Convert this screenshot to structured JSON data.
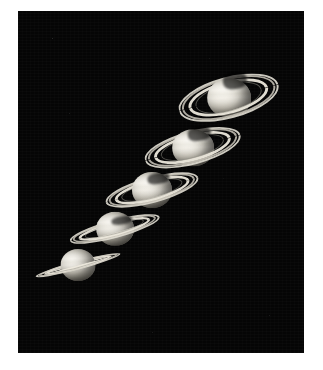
{
  "image": {
    "title": "Saturn ring-tilt sequence",
    "subject": "Saturn",
    "view_type": "photographic plate",
    "frame_count": 5,
    "background_color": "#050505",
    "border_color": "#ffffff",
    "plate": {
      "x": 18,
      "y": 11,
      "width": 286,
      "height": 342
    }
  },
  "frames": [
    {
      "id": "saturn-frame-5",
      "label": "Saturn with rings nearly edge-on",
      "order": 1,
      "center_x": 60,
      "center_y": 254,
      "globe_width": 35,
      "globe_height": 32,
      "ring_width": 88,
      "ring_height": 9,
      "ring_tilt_deg": -15,
      "ring_openness": "edge-on"
    },
    {
      "id": "saturn-frame-4",
      "label": "Saturn with slightly open rings",
      "order": 2,
      "center_x": 96,
      "center_y": 217,
      "globe_width": 38,
      "globe_height": 34,
      "ring_width": 93,
      "ring_height": 18,
      "ring_tilt_deg": -15,
      "ring_openness": "narrow"
    },
    {
      "id": "saturn-frame-3",
      "label": "Saturn with moderately open rings",
      "order": 3,
      "center_x": 134,
      "center_y": 179,
      "globe_width": 40,
      "globe_height": 36,
      "ring_width": 96,
      "ring_height": 26,
      "ring_tilt_deg": -15,
      "ring_openness": "moderate"
    },
    {
      "id": "saturn-frame-2",
      "label": "Saturn with well-open rings",
      "order": 4,
      "center_x": 174,
      "center_y": 136,
      "globe_width": 42,
      "globe_height": 37,
      "ring_width": 99,
      "ring_height": 33,
      "ring_tilt_deg": -15,
      "ring_openness": "open"
    },
    {
      "id": "saturn-frame-1",
      "label": "Saturn with rings at maximum tilt",
      "order": 5,
      "center_x": 210,
      "center_y": 86,
      "globe_width": 44,
      "globe_height": 39,
      "ring_width": 103,
      "ring_height": 41,
      "ring_tilt_deg": -15,
      "ring_openness": "maximum"
    }
  ],
  "palette": {
    "planet_light": "#f0ece1",
    "planet_mid": "#d8d3c5",
    "planet_dark": "#8b8779",
    "ring_bright": "#ece8dc",
    "ring_dim": "#ccc8bc",
    "sky": "#050505"
  }
}
